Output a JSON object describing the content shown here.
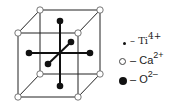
{
  "figure": {
    "type": "perovskite unit cell (CaTiO3)",
    "colors": {
      "line": "#222222",
      "background": "#ffffff"
    }
  },
  "legend": {
    "items": [
      {
        "symbol": "small-dot",
        "dash": "–",
        "element": "Ti",
        "charge": "4+"
      },
      {
        "symbol": "open-circle",
        "dash": "–",
        "element": "Ca",
        "charge": "2+"
      },
      {
        "symbol": "filled-circle",
        "dash": "–",
        "element": "O",
        "charge": "2–"
      }
    ]
  }
}
